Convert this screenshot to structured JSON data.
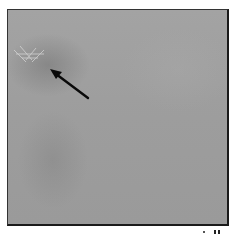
{
  "image": {
    "description": "Grayscale micrograph/photo panel with a faint crosshatch feature indicated by a black arrow",
    "annotation": {
      "type": "arrow",
      "points_to": "faint crosshatch feature",
      "color": "#000000"
    },
    "colors": {
      "panel_background": "#9c9c9c",
      "frame_border": "#1a1a1a",
      "feature_highlight": "#d8d8d8"
    }
  }
}
